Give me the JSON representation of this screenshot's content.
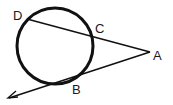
{
  "diagram": {
    "type": "circle-secant-tangent",
    "colors": {
      "stroke": "#111111",
      "background": "#ffffff"
    },
    "circle": {
      "cx": 55,
      "cy": 46,
      "r": 38
    },
    "points": {
      "A": {
        "label": "A",
        "x": 150,
        "y": 52
      },
      "B": {
        "label": "B",
        "x": 61,
        "y": 83
      },
      "C": {
        "label": "C",
        "x": 93,
        "y": 37
      },
      "D": {
        "label": "D",
        "x": 27,
        "y": 19
      }
    },
    "segments": [
      {
        "name": "secant-AD",
        "from": "A",
        "to": "D"
      },
      {
        "name": "tangent-ray-AB",
        "from": "A",
        "through": "B",
        "arrow": true
      }
    ]
  }
}
